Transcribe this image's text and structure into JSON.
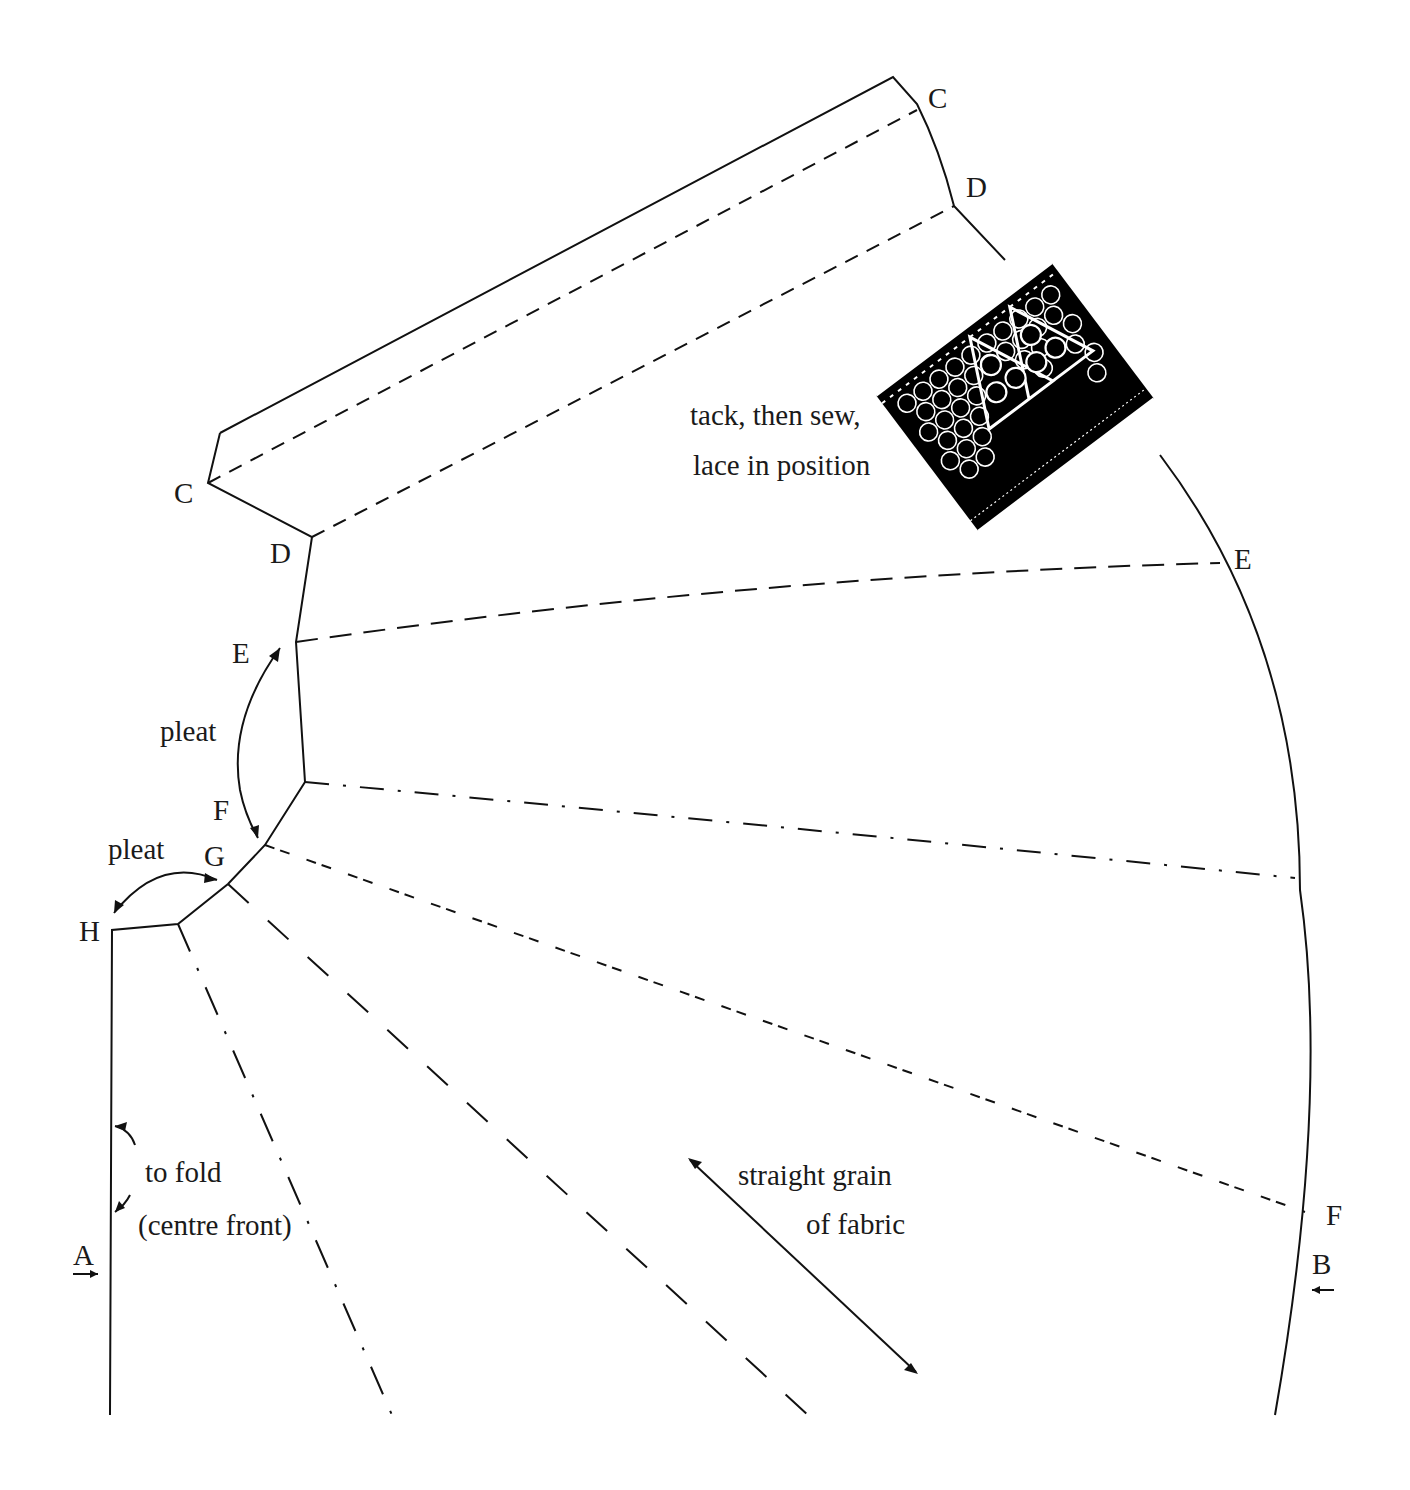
{
  "diagram": {
    "title": "",
    "type": "sewing pattern piece",
    "colors": {
      "ink": "#111111",
      "paper": "#ffffff",
      "lace": "#000000"
    },
    "point_labels": {
      "C_top": "C",
      "D_top": "D",
      "C_left": "C",
      "D_left": "D",
      "E_left": "E",
      "E_right": "E",
      "F_left": "F",
      "G": "G",
      "H": "H",
      "A": "A",
      "B": "B",
      "F_right": "F"
    },
    "annotations": {
      "lace_line1": "tack, then sew,",
      "lace_line2": "lace in position",
      "pleat_upper": "pleat",
      "pleat_lower": "pleat",
      "fold_line1": "to fold",
      "fold_line2": "(centre front)",
      "grain_line1": "straight grain",
      "grain_line2": "of fabric"
    },
    "lines": [
      {
        "from": "C (left)",
        "to": "C (top)",
        "style": "dashed"
      },
      {
        "from": "D (left)",
        "to": "D (top)",
        "style": "dashed"
      },
      {
        "from": "E (left)",
        "to": "E (right)",
        "style": "long-dash"
      },
      {
        "from": "F (left)",
        "to": "right edge",
        "style": "dash-dot"
      },
      {
        "from": "G",
        "to": "F (right)",
        "style": "short-dash"
      },
      {
        "from": "G",
        "to": "bottom",
        "style": "long-dash"
      },
      {
        "from": "H corner",
        "to": "bottom",
        "style": "dash-dot"
      }
    ]
  }
}
